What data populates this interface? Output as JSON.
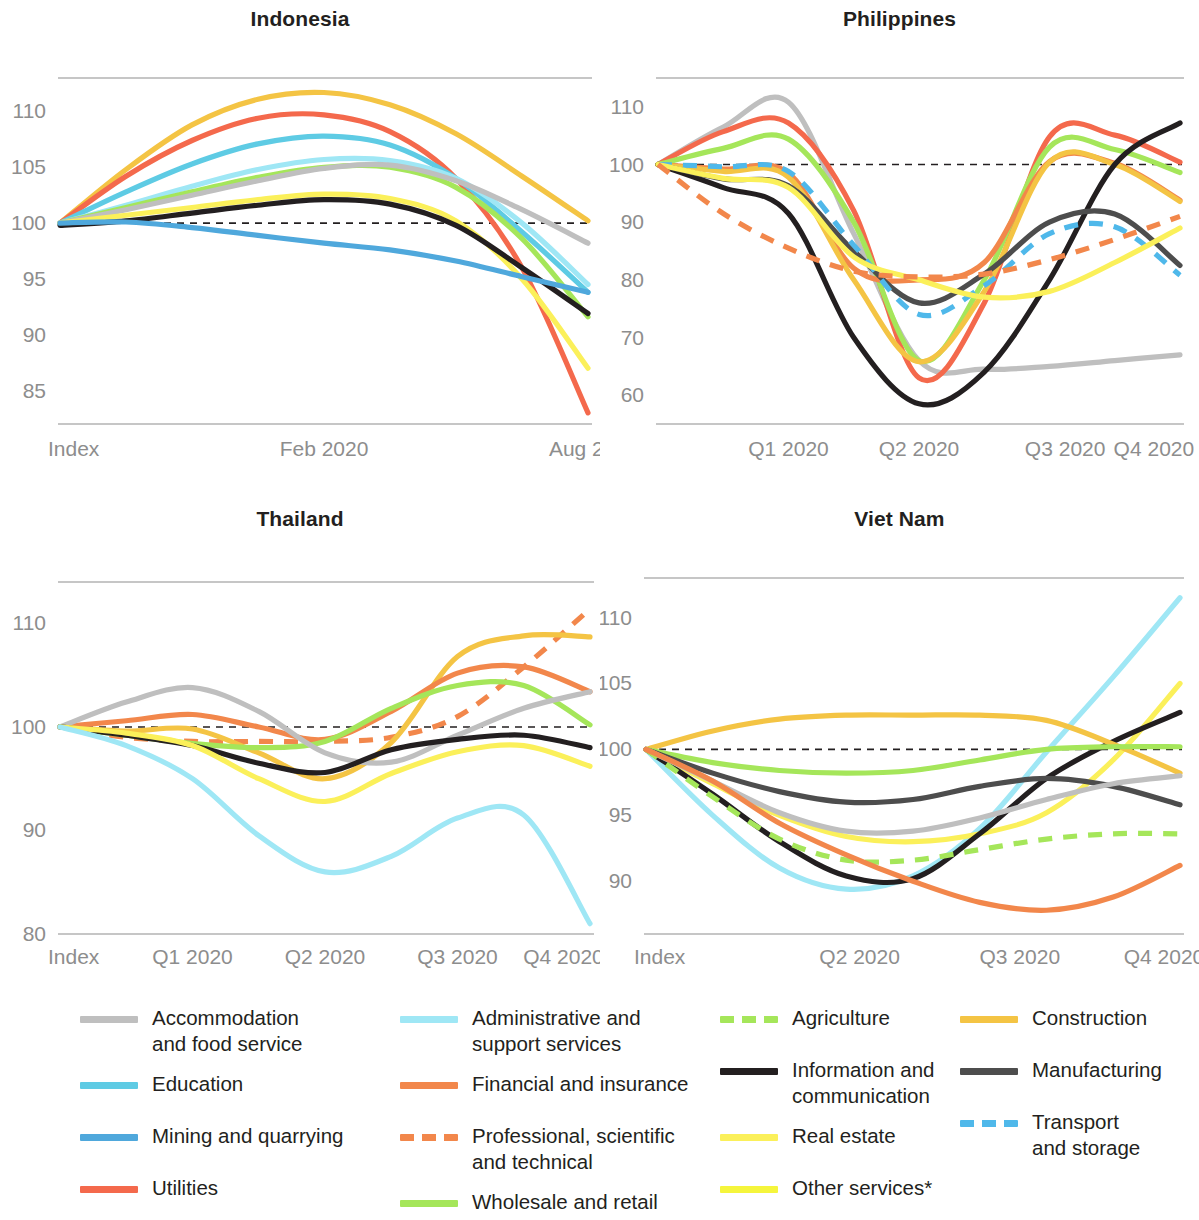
{
  "figure": {
    "background": "#ffffff",
    "index_line_value": 100,
    "index_line_color": "#231f20"
  },
  "colors": {
    "accommodation_and_food_service": "#bfbfbf",
    "administrative_and_support_services": "#9fe7f5",
    "agriculture": "#a5e65a",
    "construction": "#f4c444",
    "education": "#5ecbe4",
    "financial_and_insurance": "#f2874b",
    "information_and_communication": "#231f20",
    "manufacturing": "#4d4d4d",
    "mining_and_quarrying": "#4fa8dc",
    "professional_scientific_and_technical": "#f2874b",
    "real_estate": "#fbf05a",
    "transport_and_storage": "#4fb8ea",
    "utilities": "#f4694c",
    "wholesale_and_retail": "#a5e65a",
    "other_services": "#f5f53c",
    "axis_label": "#8d8d8d",
    "axis_line": "#b3b3b3",
    "title": "#231f20"
  },
  "legend": {
    "columns": [
      [
        {
          "label": "Accommodation\nand food service",
          "color_key": "accommodation_and_food_service",
          "dashed": false
        },
        {
          "label": "Education",
          "color_key": "education",
          "dashed": false
        },
        {
          "label": "Mining and quarrying",
          "color_key": "mining_and_quarrying",
          "dashed": false
        },
        {
          "label": "Utilities",
          "color_key": "utilities",
          "dashed": false
        }
      ],
      [
        {
          "label": "Administrative and\nsupport services",
          "color_key": "administrative_and_support_services",
          "dashed": false
        },
        {
          "label": "Financial  and insurance",
          "color_key": "financial_and_insurance",
          "dashed": false
        },
        {
          "label": "Professional, scientific\nand technical",
          "color_key": "professional_scientific_and_technical",
          "dashed": true
        },
        {
          "label": "Wholesale and retail",
          "color_key": "wholesale_and_retail",
          "dashed": false
        }
      ],
      [
        {
          "label": "Agriculture",
          "color_key": "agriculture",
          "dashed": true
        },
        {
          "label": "Information and\ncommunication",
          "color_key": "information_and_communication",
          "dashed": false
        },
        {
          "label": "Real estate",
          "color_key": "real_estate",
          "dashed": false
        },
        {
          "label": "Other services*",
          "color_key": "other_services",
          "dashed": false
        }
      ],
      [
        {
          "label": "Construction",
          "color_key": "construction",
          "dashed": false
        },
        {
          "label": "Manufacturing",
          "color_key": "manufacturing",
          "dashed": false
        },
        {
          "label": "Transport\nand  storage",
          "color_key": "transport_and_storage",
          "dashed": true
        }
      ]
    ]
  },
  "chart_data": [
    {
      "type": "line",
      "title": "Indonesia",
      "xlabel": "",
      "ylabel": "",
      "ylim": [
        82,
        113
      ],
      "yticks": [
        85,
        90,
        95,
        100,
        105,
        110
      ],
      "xticks": [
        "Index",
        "Feb 2020",
        "Aug 202"
      ],
      "xtick_positions": [
        0,
        0.5,
        1.0
      ],
      "grid": false,
      "legend_position": "bottom-shared",
      "x": [
        0,
        0.125,
        0.25,
        0.375,
        0.5,
        0.625,
        0.75,
        0.875,
        1.0
      ],
      "series": [
        {
          "name": "Construction",
          "color_key": "construction",
          "dashed": false,
          "values": [
            100,
            104.8,
            108.8,
            111.1,
            111.7,
            110.6,
            108.0,
            104.2,
            100.2
          ]
        },
        {
          "name": "Utilities",
          "color_key": "utilities",
          "dashed": false,
          "values": [
            100,
            104.2,
            107.4,
            109.4,
            109.7,
            108.2,
            104.0,
            96.0,
            83.0
          ]
        },
        {
          "name": "Education",
          "color_key": "education",
          "dashed": false,
          "values": [
            100,
            102.8,
            105.3,
            107.1,
            107.8,
            107.0,
            104.0,
            99.2,
            93.8
          ]
        },
        {
          "name": "Administrative and support services",
          "color_key": "administrative_and_support_services",
          "dashed": false,
          "values": [
            100,
            101.6,
            103.3,
            104.8,
            105.7,
            105.6,
            104.0,
            100.0,
            94.5
          ]
        },
        {
          "name": "Wholesale and retail",
          "color_key": "wholesale_and_retail",
          "dashed": false,
          "values": [
            100,
            101.4,
            102.8,
            104.1,
            105.0,
            105.0,
            103.2,
            98.6,
            91.6
          ]
        },
        {
          "name": "Accommodation and food service",
          "color_key": "accommodation_and_food_service",
          "dashed": false,
          "values": [
            100,
            101.2,
            102.5,
            103.8,
            104.9,
            105.2,
            103.8,
            101.2,
            98.2
          ]
        },
        {
          "name": "Real estate",
          "color_key": "real_estate",
          "dashed": false,
          "values": [
            100,
            100.7,
            101.4,
            102.1,
            102.6,
            102.2,
            100.2,
            95.0,
            87.0
          ]
        },
        {
          "name": "Information and communication",
          "color_key": "information_and_communication",
          "dashed": false,
          "values": [
            99.8,
            100.2,
            100.9,
            101.6,
            102.1,
            101.7,
            99.8,
            96.0,
            91.9
          ]
        },
        {
          "name": "Mining and quarrying",
          "color_key": "mining_and_quarrying",
          "dashed": false,
          "values": [
            100,
            100.1,
            99.6,
            98.9,
            98.2,
            97.6,
            96.6,
            95.2,
            93.8
          ]
        }
      ]
    },
    {
      "type": "line",
      "title": "Philippines",
      "xlabel": "",
      "ylabel": "",
      "ylim": [
        55,
        115
      ],
      "yticks": [
        60,
        70,
        80,
        90,
        100,
        110
      ],
      "xticks": [
        "Q1 2020",
        "Q2 2020",
        "Q3 2020",
        "Q4 2020"
      ],
      "xtick_positions": [
        0.25,
        0.5,
        0.78,
        0.95
      ],
      "grid": false,
      "legend_position": "bottom-shared",
      "x": [
        0,
        0.125,
        0.25,
        0.375,
        0.5,
        0.625,
        0.75,
        0.875,
        1.0
      ],
      "series": [
        {
          "name": "Accommodation and food service",
          "color_key": "accommodation_and_food_service",
          "dashed": false,
          "values": [
            100,
            106.5,
            110.8,
            88.0,
            66.0,
            64.5,
            65.0,
            66.0,
            67.0
          ]
        },
        {
          "name": "Utilities",
          "color_key": "utilities",
          "dashed": false,
          "values": [
            100,
            105.7,
            107.2,
            92.0,
            63.0,
            76.0,
            104.8,
            105.1,
            100.4
          ]
        },
        {
          "name": "Wholesale and retail",
          "color_key": "wholesale_and_retail",
          "dashed": false,
          "values": [
            100,
            102.8,
            104.4,
            90.0,
            66.0,
            80.0,
            103.0,
            102.6,
            98.6
          ]
        },
        {
          "name": "Financial and insurance",
          "color_key": "financial_and_insurance",
          "dashed": false,
          "values": [
            100,
            99.2,
            98.5,
            82.0,
            80.0,
            83.0,
            100.5,
            100.2,
            93.8
          ]
        },
        {
          "name": "Construction",
          "color_key": "construction",
          "dashed": false,
          "values": [
            100,
            98.8,
            97.8,
            80.0,
            65.8,
            78.0,
            100.4,
            100.0,
            93.6
          ]
        },
        {
          "name": "Information and communication",
          "color_key": "information_and_communication",
          "dashed": false,
          "values": [
            100,
            96.0,
            91.5,
            70.0,
            58.5,
            64.0,
            80.0,
            100.0,
            107.2
          ]
        },
        {
          "name": "Manufacturing",
          "color_key": "manufacturing",
          "dashed": false,
          "values": [
            100,
            97.5,
            96.3,
            85.0,
            76.0,
            81.0,
            90.0,
            91.4,
            82.5
          ]
        },
        {
          "name": "Transport and storage",
          "color_key": "transport_and_storage",
          "dashed": true,
          "values": [
            100,
            99.6,
            98.8,
            86.0,
            74.0,
            79.0,
            88.0,
            89.2,
            80.8
          ]
        },
        {
          "name": "Real estate",
          "color_key": "real_estate",
          "dashed": false,
          "values": [
            100,
            97.6,
            96.0,
            84.0,
            80.0,
            77.0,
            78.0,
            83.0,
            89.0
          ]
        },
        {
          "name": "Professional, scientific and technical",
          "color_key": "professional_scientific_and_technical",
          "dashed": true,
          "values": [
            100,
            91.5,
            85.5,
            81.5,
            80.5,
            81.0,
            83.5,
            87.0,
            91.0
          ]
        }
      ]
    },
    {
      "type": "line",
      "title": "Thailand",
      "xlabel": "",
      "ylabel": "",
      "ylim": [
        80,
        114
      ],
      "yticks": [
        80,
        90,
        100,
        110
      ],
      "xticks": [
        "Index",
        "Q1 2020",
        "Q2 2020",
        "Q3 2020",
        "Q4 2020"
      ],
      "xtick_positions": [
        0,
        0.25,
        0.5,
        0.75,
        0.95
      ],
      "grid": false,
      "legend_position": "bottom-shared",
      "x": [
        0,
        0.125,
        0.25,
        0.375,
        0.5,
        0.625,
        0.75,
        0.875,
        1.0
      ],
      "series": [
        {
          "name": "Professional, scientific and technical",
          "color_key": "professional_scientific_and_technical",
          "dashed": true,
          "values": [
            100,
            99.0,
            98.6,
            98.6,
            98.6,
            99.0,
            101.0,
            105.8,
            111.4
          ]
        },
        {
          "name": "Construction",
          "color_key": "construction",
          "dashed": false,
          "values": [
            100,
            99.6,
            99.8,
            97.5,
            95.0,
            98.5,
            106.8,
            108.8,
            108.7
          ]
        },
        {
          "name": "Financial and insurance",
          "color_key": "financial_and_insurance",
          "dashed": false,
          "values": [
            100,
            100.6,
            101.2,
            100.0,
            98.8,
            101.5,
            105.2,
            105.8,
            103.4
          ]
        },
        {
          "name": "Wholesale and retail",
          "color_key": "wholesale_and_retail",
          "dashed": false,
          "values": [
            100,
            99.2,
            98.4,
            98.0,
            98.6,
            101.8,
            104.0,
            104.0,
            100.2
          ]
        },
        {
          "name": "Accommodation and food service",
          "color_key": "accommodation_and_food_service",
          "dashed": false,
          "values": [
            100,
            102.4,
            103.8,
            101.5,
            97.5,
            96.6,
            99.2,
            101.8,
            103.4
          ]
        },
        {
          "name": "Information and communication",
          "color_key": "information_and_communication",
          "dashed": false,
          "values": [
            100,
            99.2,
            98.2,
            96.5,
            95.6,
            97.8,
            98.8,
            99.2,
            98.0
          ]
        },
        {
          "name": "Real estate",
          "color_key": "real_estate",
          "dashed": false,
          "values": [
            100,
            99.4,
            98.2,
            95.0,
            92.8,
            95.5,
            97.6,
            98.2,
            96.2
          ]
        },
        {
          "name": "Administrative and support services",
          "color_key": "administrative_and_support_services",
          "dashed": false,
          "values": [
            100,
            98.2,
            95.0,
            89.5,
            86.0,
            87.5,
            91.2,
            91.5,
            81.0
          ]
        }
      ]
    },
    {
      "type": "line",
      "title": "Viet Nam",
      "xlabel": "",
      "ylabel": "",
      "ylim": [
        86,
        113
      ],
      "yticks": [
        90,
        95,
        100,
        105,
        110
      ],
      "xticks": [
        "Index",
        "Q2 2020",
        "Q3 2020",
        "Q4 2020"
      ],
      "xtick_positions": [
        0,
        0.4,
        0.7,
        0.97
      ],
      "grid": false,
      "legend_position": "bottom-shared",
      "x": [
        0,
        0.125,
        0.25,
        0.375,
        0.5,
        0.625,
        0.75,
        0.875,
        1.0
      ],
      "series": [
        {
          "name": "Administrative and support services",
          "color_key": "administrative_and_support_services",
          "dashed": false,
          "values": [
            100,
            95.0,
            91.0,
            89.4,
            90.4,
            94.0,
            99.8,
            105.5,
            111.5
          ]
        },
        {
          "name": "Real estate",
          "color_key": "real_estate",
          "dashed": false,
          "values": [
            100,
            97.4,
            95.0,
            93.4,
            93.0,
            93.6,
            95.2,
            99.2,
            105.0
          ]
        },
        {
          "name": "Information and communication",
          "color_key": "information_and_communication",
          "dashed": false,
          "values": [
            100,
            96.6,
            93.0,
            90.4,
            90.2,
            93.6,
            97.8,
            100.6,
            102.8
          ]
        },
        {
          "name": "Construction",
          "color_key": "construction",
          "dashed": false,
          "values": [
            100,
            101.4,
            102.3,
            102.6,
            102.6,
            102.6,
            102.2,
            100.4,
            98.2
          ]
        },
        {
          "name": "Wholesale and retail",
          "color_key": "wholesale_and_retail",
          "dashed": false,
          "values": [
            100,
            99.0,
            98.4,
            98.2,
            98.4,
            99.2,
            100.0,
            100.2,
            100.2
          ]
        },
        {
          "name": "Manufacturing",
          "color_key": "manufacturing",
          "dashed": false,
          "values": [
            100,
            98.2,
            96.8,
            96.0,
            96.2,
            97.2,
            97.8,
            97.2,
            95.8
          ]
        },
        {
          "name": "Accommodation and food service",
          "color_key": "accommodation_and_food_service",
          "dashed": false,
          "values": [
            100,
            97.6,
            95.2,
            93.8,
            93.8,
            94.8,
            96.2,
            97.4,
            98.0
          ]
        },
        {
          "name": "Agriculture",
          "color_key": "agriculture",
          "dashed": true,
          "values": [
            100,
            96.4,
            93.2,
            91.6,
            91.6,
            92.4,
            93.2,
            93.6,
            93.6
          ]
        },
        {
          "name": "Financial and insurance",
          "color_key": "financial_and_insurance",
          "dashed": false,
          "values": [
            100,
            97.6,
            94.4,
            92.0,
            90.0,
            88.4,
            87.8,
            88.8,
            91.2
          ]
        }
      ]
    }
  ]
}
